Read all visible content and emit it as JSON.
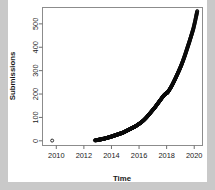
{
  "chart_data": {
    "type": "scatter",
    "title": "",
    "xlabel": "Time",
    "ylabel": "Submissions",
    "xlim": [
      2009.0,
      2020.6
    ],
    "ylim": [
      -20,
      570
    ],
    "xticks": [
      2010,
      2012,
      2014,
      2016,
      2018,
      2020
    ],
    "xticklabels": [
      "2010",
      "2012",
      "2014",
      "2016",
      "2018",
      "2020"
    ],
    "yticks": [
      0,
      100,
      200,
      300,
      400,
      500
    ],
    "yticklabels": [
      "0",
      "100",
      "200",
      "300",
      "400",
      "500"
    ],
    "grid": false,
    "legend": null,
    "marker": "open-circle",
    "marker_color": "#0a0a0a",
    "series": [
      {
        "name": "Submissions",
        "x": [
          2009.7,
          2012.8,
          2012.95,
          2013.1,
          2013.22,
          2013.34,
          2013.46,
          2013.58,
          2013.7,
          2013.82,
          2013.94,
          2014.04,
          2014.14,
          2014.24,
          2014.34,
          2014.44,
          2014.54,
          2014.64,
          2014.74,
          2014.84,
          2014.94,
          2015.04,
          2015.14,
          2015.24,
          2015.34,
          2015.44,
          2015.54,
          2015.64,
          2015.74,
          2015.84,
          2015.94,
          2016.04,
          2016.14,
          2016.24,
          2016.34,
          2016.44,
          2016.54,
          2016.64,
          2016.74,
          2016.84,
          2016.94,
          2017.04,
          2017.14,
          2017.24,
          2017.34,
          2017.44,
          2017.54,
          2017.64,
          2017.74,
          2017.84,
          2017.94,
          2018.0,
          2018.06,
          2018.14,
          2018.24,
          2018.34,
          2018.44,
          2018.54,
          2018.64,
          2018.74,
          2018.84,
          2018.94,
          2019.04,
          2019.14,
          2019.24,
          2019.34,
          2019.44,
          2019.54,
          2019.64,
          2019.74,
          2019.84,
          2019.94,
          2020.04,
          2020.14,
          2020.22
        ],
        "y": [
          1,
          2,
          3,
          5,
          6,
          8,
          9,
          11,
          13,
          15,
          17,
          19,
          21,
          23,
          25,
          27,
          29,
          31,
          33,
          35,
          38,
          41,
          44,
          47,
          50,
          53,
          56,
          59,
          62,
          66,
          70,
          74,
          78,
          83,
          88,
          94,
          100,
          107,
          114,
          121,
          128,
          135,
          142,
          150,
          158,
          166,
          174,
          182,
          190,
          197,
          202,
          204,
          206,
          213,
          222,
          232,
          243,
          255,
          267,
          280,
          293,
          306,
          320,
          335,
          351,
          368,
          386,
          404,
          422,
          441,
          460,
          480,
          505,
          532,
          555
        ]
      }
    ]
  }
}
